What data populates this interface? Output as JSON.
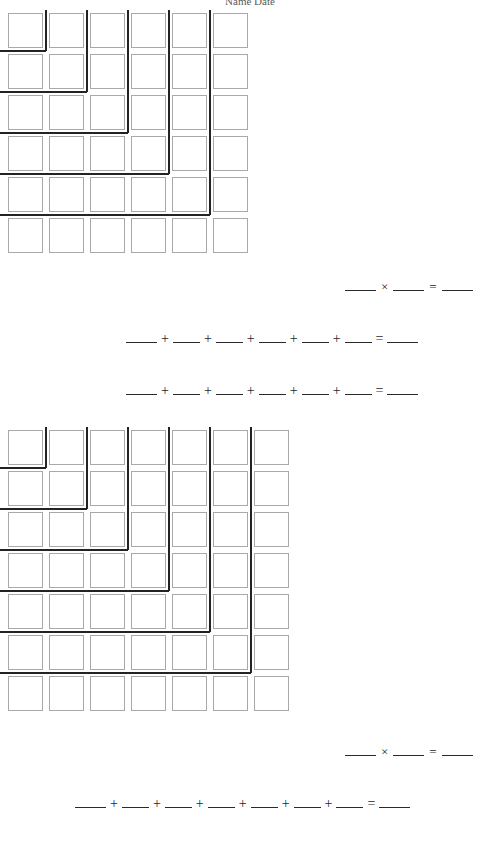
{
  "page": {
    "width": 500,
    "height": 847,
    "background": "#ffffff",
    "header_fragment": "Name                                               Date"
  },
  "style": {
    "cell_border_color": "#a9a9a9",
    "gnomon_color": "#232323",
    "blank_color": "#2a2a2a",
    "text_color": "#1f1f1f"
  },
  "sections": [
    {
      "id": "section-1",
      "grid": {
        "name": "square-grid-6x6",
        "rows": 6,
        "cols": 6,
        "origin_x": 8,
        "origin_y": 13,
        "pitch": 41,
        "cell_size": 35,
        "gnomon_count": 5,
        "gnomon_values": [
          1,
          3,
          5,
          7,
          9,
          11
        ]
      },
      "equations": [
        {
          "id": "eq-1-multiply",
          "name": "multiplication-equation",
          "type": "multiplication",
          "x": 345,
          "y": 277,
          "terms": 2,
          "operator": "×",
          "equals": "=",
          "blank_widths": [
            "w-md",
            "w-md",
            "w-md"
          ]
        },
        {
          "id": "eq-1-sum-a",
          "name": "addition-equation-a",
          "type": "addition",
          "x": 126,
          "y": 329,
          "terms": 6,
          "operator": "+",
          "equals": "=",
          "blank_widths": [
            "w-md",
            "w-sm",
            "w-sm",
            "w-sm",
            "w-sm",
            "w-sm",
            "w-md"
          ]
        },
        {
          "id": "eq-1-sum-b",
          "name": "addition-equation-b",
          "type": "addition",
          "x": 126,
          "y": 381,
          "terms": 6,
          "operator": "+",
          "equals": "=",
          "blank_widths": [
            "w-md",
            "w-sm",
            "w-sm",
            "w-sm",
            "w-sm",
            "w-sm",
            "w-md"
          ]
        }
      ]
    },
    {
      "id": "section-2",
      "grid": {
        "name": "square-grid-7x7",
        "rows": 7,
        "cols": 7,
        "origin_x": 8,
        "origin_y": 430,
        "pitch": 41,
        "cell_size": 35,
        "gnomon_count": 6,
        "gnomon_values": [
          1,
          3,
          5,
          7,
          9,
          11,
          13
        ]
      },
      "equations": [
        {
          "id": "eq-2-multiply",
          "name": "multiplication-equation",
          "type": "multiplication",
          "x": 345,
          "y": 742,
          "terms": 2,
          "operator": "×",
          "equals": "=",
          "blank_widths": [
            "w-md",
            "w-md",
            "w-md"
          ]
        },
        {
          "id": "eq-2-sum",
          "name": "addition-equation",
          "type": "addition",
          "x": 75,
          "y": 794,
          "terms": 7,
          "operator": "+",
          "equals": "=",
          "blank_widths": [
            "w-md",
            "w-sm",
            "w-sm",
            "w-sm",
            "w-sm",
            "w-sm",
            "w-sm",
            "w-md"
          ]
        }
      ]
    }
  ]
}
